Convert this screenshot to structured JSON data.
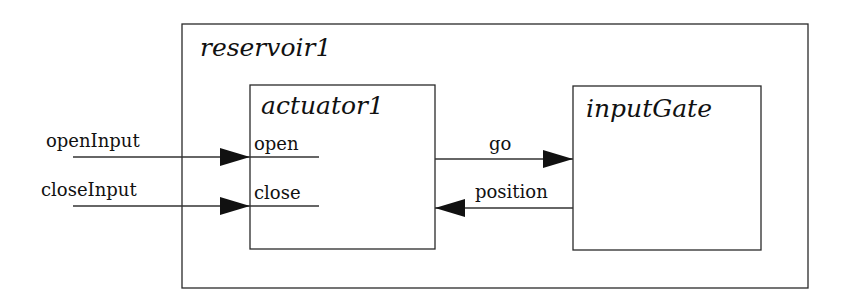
{
  "diagram": {
    "container": {
      "name": "reservoir1"
    },
    "blocks": [
      {
        "name": "actuator1",
        "ports": {
          "inputs": [
            "open",
            "close"
          ]
        }
      },
      {
        "name": "inputGate"
      }
    ],
    "external_inputs": [
      "openInput",
      "closeInput"
    ],
    "connections": [
      {
        "from": "openInput",
        "to": "actuator1.open",
        "label": "openInput"
      },
      {
        "from": "closeInput",
        "to": "actuator1.close",
        "label": "closeInput"
      },
      {
        "from": "actuator1",
        "to": "inputGate",
        "label": "go"
      },
      {
        "from": "inputGate",
        "to": "actuator1",
        "label": "position"
      }
    ]
  }
}
